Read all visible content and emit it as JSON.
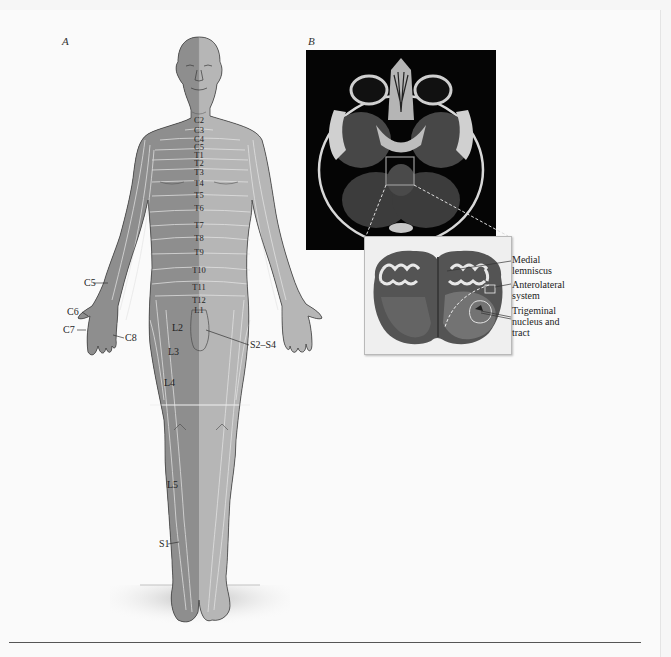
{
  "figure": {
    "panels": [
      {
        "id": "A",
        "letter": "A",
        "description": "Dermatome map of the human body, anterior view"
      },
      {
        "id": "B",
        "letter": "B",
        "description": "Axial MRI of the brainstem with magnified histological section of the medulla"
      }
    ]
  },
  "panel_a": {
    "letter": "A",
    "spinal_labels": [
      "C2",
      "C3",
      "C4",
      "C5",
      "T1",
      "T2",
      "T3",
      "T4",
      "T5",
      "T6",
      "T7",
      "T8",
      "T9",
      "T10",
      "T11",
      "T12",
      "L1"
    ],
    "limb_labels": {
      "c5": "C5",
      "c6": "C6",
      "c7": "C7",
      "c8": "C8",
      "l2": "L2",
      "l3": "L3",
      "l4": "L4",
      "l5": "L5",
      "s1": "S1",
      "s2_s4": "S2–S4"
    },
    "colors": {
      "skin_left": "#8d8d8d",
      "skin_right": "#b4b4b4",
      "dermatome_lines": "#e8e8e8",
      "outline": "#4a4a4a"
    }
  },
  "panel_b": {
    "letter": "B",
    "annotations": [
      {
        "id": "medial-lemniscus",
        "lines": [
          "Medial",
          "lemniscus"
        ]
      },
      {
        "id": "anterolateral-system",
        "lines": [
          "Anterolateral",
          "system"
        ]
      },
      {
        "id": "trigeminal-nucleus",
        "lines": [
          "Trigeminal",
          "nucleus and",
          "tract"
        ]
      }
    ]
  }
}
